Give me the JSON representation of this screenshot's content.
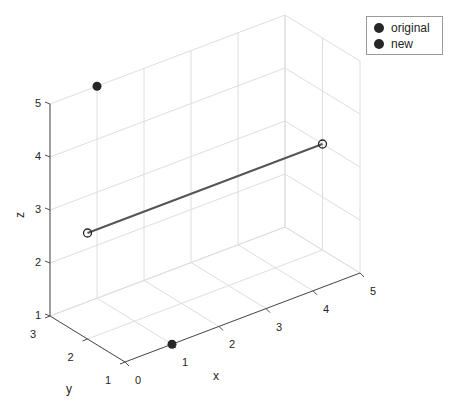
{
  "chart_data": {
    "type": "scatter3d",
    "title": "",
    "xlabel": "x",
    "ylabel": "y",
    "zlabel": "z",
    "xlim": [
      0,
      5
    ],
    "ylim": [
      1,
      3
    ],
    "zlim": [
      1,
      5
    ],
    "x_ticks": [
      "0",
      "1",
      "2",
      "3",
      "4",
      "5"
    ],
    "y_ticks": [
      "1",
      "2",
      "3"
    ],
    "z_ticks": [
      "1",
      "2",
      "3",
      "4",
      "5"
    ],
    "grid": true,
    "legend_position": "top-right",
    "series": [
      {
        "name": "original",
        "marker": "filled-circle",
        "color": "#262626",
        "points": [
          [
            1,
            1,
            1
          ],
          [
            1,
            3,
            5
          ]
        ]
      },
      {
        "name": "new",
        "marker": "filled-circle",
        "color": "#262626",
        "points": []
      },
      {
        "name": "segment",
        "marker": "open-circle",
        "line": true,
        "color": "#555555",
        "points": [
          [
            0,
            2,
            3
          ],
          [
            5,
            2,
            3
          ]
        ]
      }
    ]
  },
  "legend": {
    "items": [
      {
        "label": "original"
      },
      {
        "label": "new"
      }
    ]
  }
}
